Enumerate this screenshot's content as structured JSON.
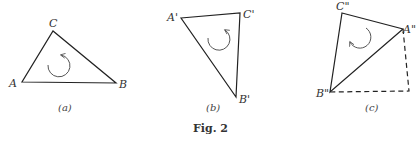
{
  "figure": {
    "caption": "Fig. 2",
    "panels": [
      {
        "id": "a",
        "label": "(a)",
        "vertices": {
          "A": "A",
          "B": "B",
          "C": "C"
        },
        "rotation": "counterclockwise"
      },
      {
        "id": "b",
        "label": "(b)",
        "vertices": {
          "A": "A'",
          "B": "B'",
          "C": "C'"
        },
        "rotation": "clockwise"
      },
      {
        "id": "c",
        "label": "(c)",
        "vertices": {
          "A": "A\"",
          "B": "B\"",
          "C": "C\""
        },
        "rotation": "counterclockwise",
        "dashed_extension": true
      }
    ]
  },
  "colors": {
    "line": "#222222",
    "arrow": "#555555",
    "background": "#ffffff"
  }
}
